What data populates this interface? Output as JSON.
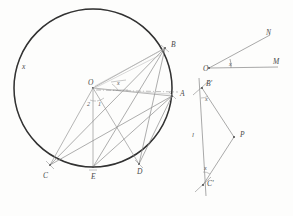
{
  "figure": {
    "style": {
      "paper_color": "#fdfdfc",
      "circle_stroke": "#1e1e1e",
      "chord_stroke": "#8a8a8a",
      "construction_stroke": "#a6a6a6",
      "ink_color": "#3a3a3a"
    },
    "circle": {
      "name": "main-circle",
      "center_x": 93,
      "center_y": 88,
      "radius": 79,
      "center_label": "O"
    },
    "circle_labels": [
      {
        "id": "x-arc",
        "text": "x",
        "x": 22,
        "y": 63
      },
      {
        "id": "B",
        "text": "B",
        "x": 171,
        "y": 44
      },
      {
        "id": "A",
        "text": "A",
        "x": 180,
        "y": 94
      },
      {
        "id": "C",
        "text": "C",
        "x": 45,
        "y": 176
      },
      {
        "id": "E",
        "text": "E",
        "x": 93,
        "y": 186
      },
      {
        "id": "D",
        "text": "D",
        "x": 138,
        "y": 174
      },
      {
        "id": "O",
        "text": "O",
        "x": 88,
        "y": 80
      }
    ],
    "circle_angle_labels": [
      {
        "id": "ang-x-top",
        "text": "x",
        "x": 119,
        "y": 83
      },
      {
        "id": "ang-2",
        "text": "2",
        "x": 88,
        "y": 104
      },
      {
        "id": "ang-1",
        "text": "1",
        "x": 99,
        "y": 104
      }
    ],
    "angle_figure": {
      "name": "angle-ONM",
      "vertex_label": "O",
      "ray_upper_label": "N",
      "ray_right_label": "M",
      "angle_label": "x",
      "vertex_x": 209,
      "vertex_y": 68,
      "n_x": 270,
      "n_y": 34,
      "m_x": 278,
      "m_y": 66
    },
    "triangle_figure": {
      "name": "triangle-B-prime-P-C-prime",
      "vertex_top_label": "B'",
      "vertex_bottom_label": "C'",
      "vertex_right_label": "P",
      "angle_top_label": "x",
      "angle_bottom_label": "x",
      "side_label": "l",
      "b_x": 202,
      "b_y": 88,
      "c_x": 203,
      "c_y": 185,
      "p_x": 234,
      "p_y": 137
    },
    "triangle_labels": [
      {
        "id": "B-prime",
        "text": "B'",
        "x": 207,
        "y": 84,
        "kind": "pt"
      },
      {
        "id": "C-prime",
        "text": "C'",
        "x": 207,
        "y": 183,
        "kind": "pt"
      },
      {
        "id": "P",
        "text": "P",
        "x": 241,
        "y": 134,
        "kind": "pt"
      },
      {
        "id": "ang-top",
        "text": "x",
        "x": 206,
        "y": 99,
        "kind": "ang"
      },
      {
        "id": "ang-bottom",
        "text": "x",
        "x": 205,
        "y": 168,
        "kind": "ang"
      },
      {
        "id": "side-l",
        "text": "l",
        "x": 193,
        "y": 135,
        "kind": "side"
      }
    ],
    "inscribed_points": {
      "A": {
        "x": 172,
        "y": 96
      },
      "B": {
        "x": 165,
        "y": 48
      },
      "C": {
        "x": 50,
        "y": 165
      },
      "D": {
        "x": 139,
        "y": 164
      },
      "E": {
        "x": 93,
        "y": 167
      }
    }
  }
}
